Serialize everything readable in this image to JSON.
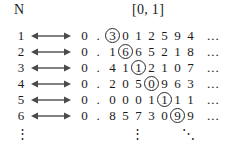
{
  "figure": {
    "set_label": "N",
    "interval_label": "[0, 1]",
    "continuation_symbol": "⋮",
    "corner_symbol": "⋱",
    "row_tail": "...",
    "leading_zero": "0",
    "decimal_point": ".",
    "arrow_icon": "double-headed-arrow",
    "ink_color": "#1a1a1a",
    "arrow_color": "#4a4a4a",
    "circle_color": "#2a2a2a",
    "background_color": "#ffffff"
  },
  "rows": [
    {
      "index": "1",
      "digits": [
        "3",
        "0",
        "1",
        "2",
        "5",
        "9",
        "4"
      ],
      "circled_position": 1
    },
    {
      "index": "2",
      "digits": [
        "1",
        "6",
        "6",
        "5",
        "2",
        "1",
        "8"
      ],
      "circled_position": 2
    },
    {
      "index": "3",
      "digits": [
        "4",
        "1",
        "1",
        "2",
        "1",
        "0",
        "7"
      ],
      "circled_position": 3
    },
    {
      "index": "4",
      "digits": [
        "2",
        "0",
        "5",
        "0",
        "9",
        "6",
        "3"
      ],
      "circled_position": 4
    },
    {
      "index": "5",
      "digits": [
        "0",
        "0",
        "0",
        "1",
        "1",
        "1",
        "1"
      ],
      "circled_position": 5
    },
    {
      "index": "6",
      "digits": [
        "8",
        "5",
        "7",
        "3",
        "0",
        "9",
        "9"
      ],
      "circled_position": 6
    }
  ]
}
